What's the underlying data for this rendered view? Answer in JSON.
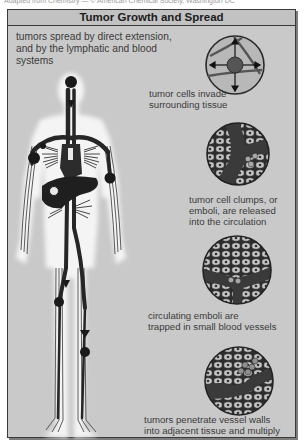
{
  "credit_line": "Adapted from Chemistry — © American Chemical Society, Washington DC",
  "title": "Tumor Growth and Spread",
  "intro": "tumors spread by direct extension, and by the lymphatic and blood systems",
  "stages": [
    {
      "id": "invade",
      "caption_line1": "tumor cells invade",
      "caption_line2": "surrounding tissue",
      "icon": "tumor-invasion-circle-icon"
    },
    {
      "id": "release",
      "caption_line1": "tumor cell clumps, or",
      "caption_line2": "emboli, are released",
      "caption_line3": "into the circulation",
      "icon": "emboli-release-circle-icon"
    },
    {
      "id": "trapped",
      "caption_line1": "circulating emboli are",
      "caption_line2": "trapped in small blood vessels",
      "icon": "emboli-trapped-circle-icon"
    },
    {
      "id": "penetrate",
      "caption_line1": "tumors penetrate vessel walls",
      "caption_line2": "into adjacent tissue and multiply",
      "icon": "vessel-penetration-circle-icon"
    }
  ],
  "figure": {
    "icon": "human-body-icon"
  },
  "colors": {
    "panel_bg": "#c9c9c9",
    "header_bg": "#c2c2c2",
    "border": "#3a3a3a",
    "vessel": "#2a2a2a",
    "tissue": "#8a8a8a",
    "body_glow": "#f2f2f2",
    "text": "#3b3b3b"
  }
}
